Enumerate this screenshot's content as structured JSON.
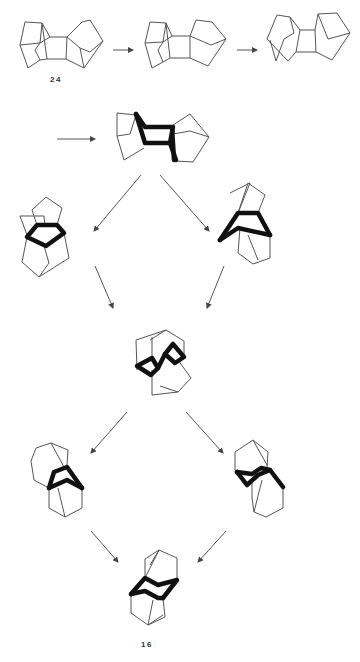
{
  "diagram": {
    "type": "chemical-rearrangement-scheme",
    "labels": {
      "start_compound": "24",
      "end_compound": "16"
    },
    "colors": {
      "background": "#ffffff",
      "thin_bond": "#555555",
      "bold_bond": "#111111"
    },
    "rows": [
      {
        "row": 1,
        "structures": [
          "compound-24",
          "intermediate-1a",
          "intermediate-1b"
        ],
        "arrows": [
          "right",
          "right"
        ]
      },
      {
        "row": 2,
        "structures": [
          "intermediate-2"
        ],
        "arrows": [
          "right"
        ]
      },
      {
        "row": 3,
        "structures": [
          "intermediate-3-left",
          "intermediate-3-right"
        ],
        "arrows": [
          "down-left",
          "down-right"
        ]
      },
      {
        "row": 4,
        "structures": [
          "intermediate-4-center"
        ],
        "arrows": [
          "down-right",
          "down-left"
        ]
      },
      {
        "row": 5,
        "structures": [
          "intermediate-5-left",
          "intermediate-5-right"
        ],
        "arrows": [
          "down-left",
          "down-right"
        ]
      },
      {
        "row": 6,
        "structures": [
          "compound-16"
        ],
        "arrows": [
          "down-right",
          "down-left"
        ]
      }
    ]
  }
}
